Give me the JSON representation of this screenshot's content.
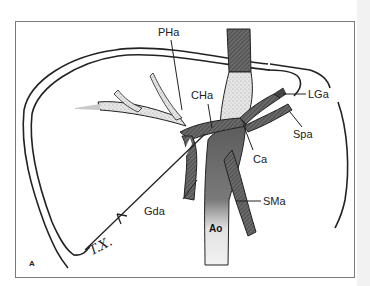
{
  "figure": {
    "panel_letter": "A",
    "signature": "T.X.",
    "labels": {
      "pha": "PHa",
      "cha": "CHa",
      "lga": "LGa",
      "spa": "Spa",
      "ca": "Ca",
      "gda": "Gda",
      "sma": "SMa",
      "ao": "Ao"
    },
    "colors": {
      "ink": "#222222",
      "vessel_dark": "#555555",
      "vessel_light": "#d8d8d8",
      "frame": "#7a7a7a"
    }
  }
}
